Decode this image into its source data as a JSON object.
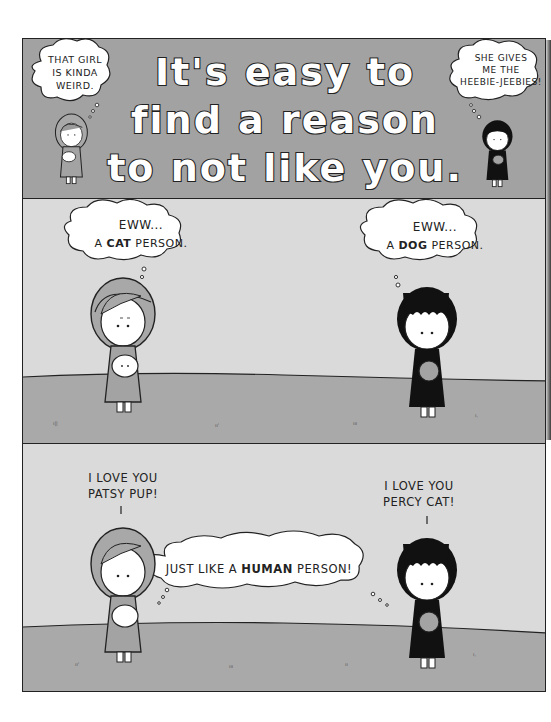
{
  "comic": {
    "panel1": {
      "title_lines": [
        "It's easy to",
        "find a reason",
        "to not like you."
      ],
      "left_thought": [
        "THAT GIRL",
        "IS KINDA",
        "WEIRD."
      ],
      "right_thought": [
        "SHE GIVES",
        "ME THE",
        "HEEBIE-JEEBIES!"
      ]
    },
    "panel2": {
      "left_thought": {
        "line1": "EWW...",
        "prefix": "A ",
        "bold": "CAT",
        "suffix": " PERSON."
      },
      "right_thought": {
        "line1": "EWW...",
        "prefix": "A ",
        "bold": "DOG",
        "suffix": " PERSON."
      }
    },
    "panel3": {
      "left_speech": [
        "I LOVE YOU",
        "PATSY PUP!"
      ],
      "right_speech": [
        "I LOVE YOU",
        "PERCY CAT!"
      ],
      "shared_thought": {
        "prefix": "JUST LIKE A ",
        "bold": "HUMAN",
        "suffix": " PERSON!"
      }
    },
    "characters": {
      "left": {
        "description": "girl with light hair holding a white dog"
      },
      "right": {
        "description": "girl with black hair holding a cat"
      }
    }
  },
  "colors": {
    "title_panel_bg": "#a2a2a2",
    "sky": "#dadada",
    "ground": "#a9a9a9",
    "ink": "#222222"
  }
}
